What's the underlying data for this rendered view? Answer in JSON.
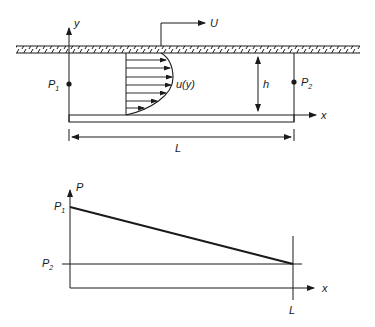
{
  "figure": {
    "top_diagram": {
      "description": "Couette-Poiseuille flow between a stationary lower plate and a moving upper wall",
      "labels": {
        "y_axis": "y",
        "x_axis": "x",
        "wall_velocity": "U",
        "velocity_profile": "u(y)",
        "gap_height": "h",
        "length": "L",
        "p1_main": "P",
        "p1_sub": "1",
        "p2_main": "P",
        "p2_sub": "2"
      }
    },
    "bottom_diagram": {
      "description": "Linear pressure drop from P1 at x=0 to P2 at x=L",
      "labels": {
        "y_axis": "P",
        "x_axis": "x",
        "length": "L",
        "p1_main": "P",
        "p1_sub": "1",
        "p2_main": "P",
        "p2_sub": "2"
      }
    }
  },
  "colors": {
    "ink": "#1a1a1a",
    "background": "#ffffff"
  }
}
